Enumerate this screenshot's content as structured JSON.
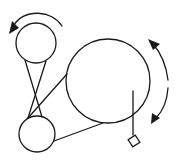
{
  "diagram": {
    "width": 176,
    "height": 160,
    "colors": {
      "background": "#ffffff",
      "stroke": "#1a1a1a"
    },
    "elements": {
      "top_pulley": {
        "cx": 36,
        "cy": 43,
        "r": 20
      },
      "bottom_pulley": {
        "cx": 37,
        "cy": 134,
        "r": 18
      },
      "large_wheel": {
        "cx": 108,
        "cy": 81,
        "r": 42
      },
      "pendulum": {
        "x": 133,
        "y1": 91,
        "y2": 134
      },
      "weight_diamond": {
        "cx": 134,
        "cy": 141,
        "half": 6
      }
    },
    "arrows": [
      {
        "name": "top-pulley-rotation-arrow",
        "direction": "counterclockwise"
      },
      {
        "name": "large-wheel-upper-arrow",
        "direction": "counterclockwise-up"
      },
      {
        "name": "large-wheel-lower-arrow",
        "direction": "clockwise-down"
      }
    ]
  }
}
